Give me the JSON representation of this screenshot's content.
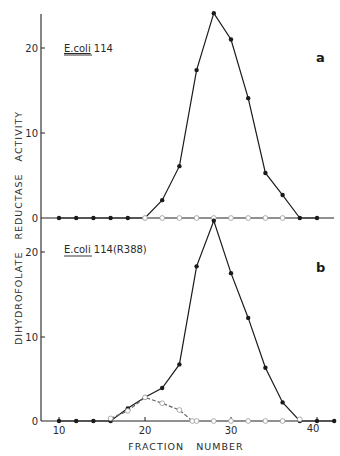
{
  "chart_data": [
    {
      "type": "line",
      "panel_label": "a",
      "annotation": "E.coli 114",
      "annotation_underlined": "E.coli",
      "xlabel": "FRACTION NUMBER",
      "ylabel": "DIHYDROFOLATE REDUCTASE ACTIVITY",
      "xlim": [
        8,
        43
      ],
      "ylim": [
        0,
        25
      ],
      "yticks": [
        0,
        10,
        20
      ],
      "xticks": [
        10,
        20,
        30,
        40
      ],
      "grid": false,
      "series": [
        {
          "name": "closed circles",
          "marker": "filled-circle",
          "line": "solid",
          "x": [
            10,
            12,
            14,
            16,
            18,
            20,
            22,
            24,
            26,
            28,
            30,
            32,
            34,
            36,
            38,
            40
          ],
          "y": [
            0,
            0,
            0,
            0,
            0,
            0,
            2.1,
            6.1,
            17.4,
            24.1,
            21.0,
            14.1,
            5.3,
            2.7,
            0,
            0
          ]
        },
        {
          "name": "open circles",
          "marker": "open-circle",
          "line": "none",
          "x": [
            20,
            22,
            24,
            26,
            28,
            30,
            32,
            34,
            36
          ],
          "y": [
            0,
            0,
            0,
            0,
            0,
            0,
            0,
            0,
            0
          ]
        }
      ]
    },
    {
      "type": "line",
      "panel_label": "b",
      "annotation": "E.coli 114(R388)",
      "annotation_underlined": "E.coli",
      "xlabel": "FRACTION NUMBER",
      "ylabel": "DIHYDROFOLATE REDUCTASE ACTIVITY",
      "xlim": [
        8,
        43
      ],
      "ylim": [
        0,
        25
      ],
      "yticks": [
        0,
        10,
        20
      ],
      "xticks": [
        10,
        20,
        30,
        40
      ],
      "grid": false,
      "series": [
        {
          "name": "closed circles",
          "marker": "filled-circle",
          "line": "solid",
          "x": [
            10,
            12,
            14,
            16,
            18,
            20,
            22,
            24,
            26,
            28,
            30,
            32,
            34,
            36,
            38,
            40,
            42
          ],
          "y": [
            0,
            0,
            0,
            0,
            1.5,
            2.8,
            3.9,
            6.7,
            18.3,
            23.7,
            17.5,
            12.2,
            6.3,
            2.2,
            0,
            0,
            0
          ]
        },
        {
          "name": "open circles",
          "marker": "open-circle",
          "line": "dashed",
          "x": [
            16,
            18,
            20,
            22,
            24,
            25.5
          ],
          "y": [
            0.3,
            1.2,
            2.8,
            2.1,
            1.3,
            0
          ]
        },
        {
          "name": "open circles baseline",
          "marker": "open-circle",
          "line": "none",
          "x": [
            26,
            28,
            30,
            32,
            34,
            36,
            38
          ],
          "y": [
            0,
            0,
            0,
            0,
            0,
            0,
            0.2
          ]
        }
      ]
    }
  ],
  "labels": {
    "a_title": "E.coli",
    "a_title_rest": " 114",
    "b_title": "E.coli",
    "b_title_rest": " 114(R388)",
    "panel_a": "a",
    "panel_b": "b",
    "ylabel": "DIHYDROFOLATE   REDUCTASE   ACTIVITY",
    "xlabel": "FRACTION   NUMBER",
    "ytick_0": "0",
    "ytick_10": "10",
    "ytick_20": "20",
    "xtick_10": "10",
    "xtick_20": "20",
    "xtick_30": "30",
    "xtick_40": "40"
  }
}
